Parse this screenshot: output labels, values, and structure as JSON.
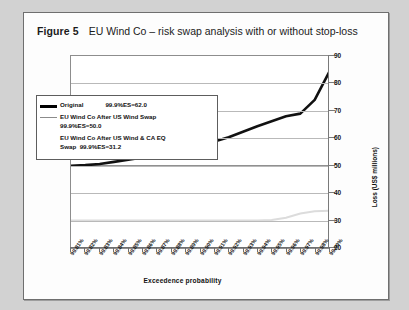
{
  "figure": {
    "label": "Figure 5",
    "title": "EU Wind Co – risk swap analysis with or without stop-loss"
  },
  "legend": {
    "items": [
      {
        "name": "Original",
        "stat": "99.9%ES=62.0",
        "color": "#000000",
        "line": "original-line"
      },
      {
        "name": "EU Wind Co After US Wind Swap",
        "stat": "99.9%ES=50.0",
        "color": "#8b8b8b",
        "line": "us-wind-swap-line"
      },
      {
        "name": "EU Wind Co After US Wind & CA EQ Swap",
        "stat": "99.9%ES=31.2",
        "color": "#d8d8d8",
        "line": "us-wind-ca-eq-swap-line"
      }
    ]
  },
  "chart_data": {
    "type": "line",
    "title": "EU Wind Co – risk swap analysis with or without stop-loss",
    "xlabel": "Exceedence probability",
    "ylabel": "Loss (US$ millions)",
    "ylim": [
      20,
      90
    ],
    "yticks": [
      20,
      30,
      40,
      50,
      60,
      70,
      80,
      90
    ],
    "grid": true,
    "legend_position": "upper-left",
    "categories": [
      "99.81%",
      "99.82%",
      "99.83%",
      "99.84%",
      "99.85%",
      "99.86%",
      "99.87%",
      "99.88%",
      "99.89%",
      "99.90%",
      "99.91%",
      "99.92%",
      "99.93%",
      "99.94%",
      "99.95%",
      "99.96%",
      "99.97%",
      "99.98%",
      "99.99%"
    ],
    "series": [
      {
        "name": "Original",
        "stat": "99.9%ES=62.0",
        "color": "#111111",
        "values": [
          50.0,
          50.2,
          50.6,
          51.4,
          52.2,
          53.0,
          53.6,
          55.2,
          56.4,
          57.6,
          58.8,
          60.4,
          62.4,
          64.4,
          66.2,
          68.0,
          69.0,
          74.0,
          84.0
        ]
      },
      {
        "name": "EU Wind Co After US Wind Swap",
        "stat": "99.9%ES=50.0",
        "color": "#909090",
        "values": [
          50.0,
          50.0,
          50.0,
          50.0,
          50.0,
          50.0,
          50.0,
          50.0,
          50.0,
          50.0,
          50.0,
          50.0,
          50.0,
          50.0,
          50.0,
          50.0,
          50.0,
          50.0,
          50.0
        ]
      },
      {
        "name": "EU Wind Co After US Wind & CA EQ Swap",
        "stat": "99.9%ES=31.2",
        "color": "#dcdcdc",
        "values": [
          30.0,
          30.0,
          30.0,
          30.0,
          30.0,
          30.0,
          30.0,
          30.0,
          30.0,
          30.0,
          30.0,
          30.0,
          30.0,
          30.0,
          30.2,
          31.0,
          32.6,
          33.4,
          33.6
        ]
      }
    ]
  }
}
